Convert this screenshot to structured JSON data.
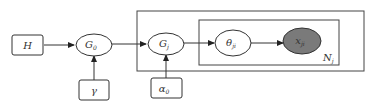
{
  "diagram": {
    "type": "plate-notation graphical model",
    "nodes": [
      {
        "id": "H",
        "label": "H",
        "sub": "",
        "shape": "box",
        "observed": false
      },
      {
        "id": "G0",
        "label": "G",
        "sub": "0",
        "shape": "ellipse",
        "observed": false
      },
      {
        "id": "gamma",
        "label": "γ",
        "sub": "",
        "shape": "box",
        "observed": false
      },
      {
        "id": "Gj",
        "label": "G",
        "sub": "j",
        "shape": "ellipse",
        "observed": false
      },
      {
        "id": "alpha0",
        "label": "α",
        "sub": "0",
        "shape": "box",
        "observed": false
      },
      {
        "id": "theta",
        "label": "θ",
        "sub": "ji",
        "shape": "ellipse",
        "observed": false
      },
      {
        "id": "x",
        "label": "x",
        "sub": "ji",
        "shape": "ellipse",
        "observed": true
      }
    ],
    "edges": [
      {
        "from": "H",
        "to": "G0"
      },
      {
        "from": "gamma",
        "to": "G0"
      },
      {
        "from": "G0",
        "to": "Gj"
      },
      {
        "from": "alpha0",
        "to": "Gj"
      },
      {
        "from": "Gj",
        "to": "theta"
      },
      {
        "from": "theta",
        "to": "x"
      }
    ],
    "plates": [
      {
        "id": "outer",
        "label": "",
        "contains": [
          "Gj",
          "theta",
          "x"
        ]
      },
      {
        "id": "inner",
        "label": "N",
        "sub": "j",
        "contains": [
          "theta",
          "x"
        ]
      }
    ],
    "colors": {
      "line": "#333333",
      "observed_fill": "#7a7a7a",
      "background": "#ffffff"
    }
  }
}
